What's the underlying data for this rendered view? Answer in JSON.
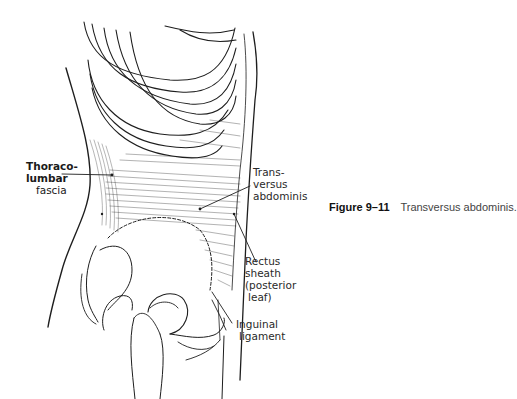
{
  "figure": {
    "number": "Figure 9–11",
    "caption": "Transversus abdominis."
  },
  "labels": {
    "thoracolumbar": [
      "Thoraco-",
      "lumbar",
      "fascia"
    ],
    "transversus": [
      "Trans-",
      "versus",
      "abdominis"
    ],
    "rectus_sheath": [
      "Rectus",
      "sheath",
      "(posterior",
      "leaf)"
    ],
    "inguinal": [
      "Inguinal",
      "ligament"
    ]
  },
  "colors": {
    "ink": "#1e1e1e",
    "background": "#ffffff"
  }
}
